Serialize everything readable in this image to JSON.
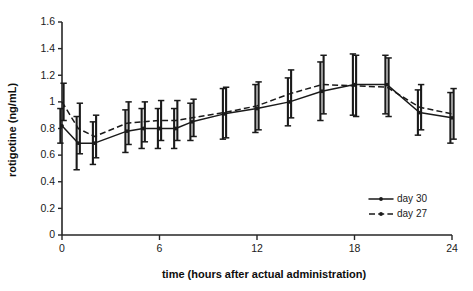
{
  "chart_data": {
    "type": "line",
    "title": "",
    "xlabel": "time (hours after actual administration)",
    "ylabel": "rotigotine (ng/mL)",
    "xlim": [
      0,
      24
    ],
    "ylim": [
      0,
      1.6
    ],
    "xticks": [
      0,
      6,
      12,
      18,
      24
    ],
    "xtick_labels": [
      "0",
      "6",
      "12",
      "18",
      "24"
    ],
    "yticks": [
      0,
      0.2,
      0.4,
      0.6,
      0.8,
      1.0,
      1.2,
      1.4,
      1.6
    ],
    "ytick_labels": [
      "0",
      "0.2",
      "0.4",
      "0.6",
      "0.8",
      "1",
      "1.2",
      "1.4",
      "1.6"
    ],
    "grid": false,
    "legend_position": "lower-right",
    "error_bars": "symmetric",
    "x": [
      0,
      1,
      2,
      4,
      5,
      6,
      7,
      8,
      10,
      12,
      14,
      16,
      18,
      20,
      22,
      24
    ],
    "series": [
      {
        "name": "day 30",
        "style": "solid",
        "marker": "filled-circle",
        "values": [
          0.82,
          0.69,
          0.69,
          0.78,
          0.8,
          0.8,
          0.8,
          0.85,
          0.91,
          0.95,
          1.0,
          1.08,
          1.13,
          1.13,
          0.92,
          0.88
        ],
        "errors": [
          0.13,
          0.2,
          0.16,
          0.16,
          0.15,
          0.15,
          0.15,
          0.14,
          0.19,
          0.18,
          0.18,
          0.22,
          0.23,
          0.22,
          0.17,
          0.19
        ]
      },
      {
        "name": "day 27",
        "style": "dashed",
        "marker": "filled-circle",
        "values": [
          1.0,
          0.8,
          0.74,
          0.84,
          0.85,
          0.86,
          0.86,
          0.88,
          0.92,
          0.97,
          1.06,
          1.13,
          1.12,
          1.11,
          0.96,
          0.91
        ],
        "errors": [
          0.14,
          0.19,
          0.16,
          0.16,
          0.15,
          0.15,
          0.15,
          0.14,
          0.19,
          0.18,
          0.18,
          0.22,
          0.23,
          0.22,
          0.17,
          0.19
        ]
      }
    ],
    "legend": [
      {
        "label": "day 30",
        "style": "solid"
      },
      {
        "label": "day 27",
        "style": "dashed"
      }
    ],
    "colors": {
      "line": "#1a1a1a",
      "axis": "#262626",
      "background": "#ffffff"
    }
  }
}
